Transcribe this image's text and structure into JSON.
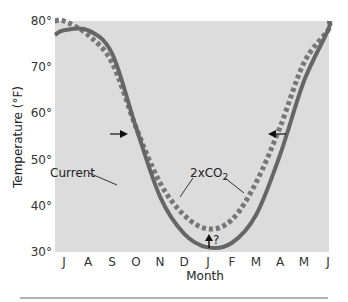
{
  "chart_data": {
    "type": "line",
    "title": "",
    "xlabel": "Month",
    "ylabel": "Temperature (°F)",
    "ylim": [
      30,
      80
    ],
    "yticks": [
      "30°",
      "40°",
      "50°",
      "60°",
      "70°",
      "80°"
    ],
    "categories": [
      "J",
      "A",
      "S",
      "O",
      "N",
      "D",
      "J",
      "F",
      "M",
      "A",
      "M",
      "J"
    ],
    "grid": false,
    "legend": "inline annotations",
    "series": [
      {
        "name": "Current",
        "style": "solid",
        "color": "#666666",
        "values": [
          78,
          78,
          73,
          57,
          42,
          34,
          31,
          32,
          38,
          51,
          67,
          78
        ]
      },
      {
        "name": "2xCO2",
        "style": "dotted",
        "color": "#777777",
        "values": [
          80,
          77,
          71,
          57,
          45,
          38,
          35,
          37,
          45,
          57,
          71,
          78
        ]
      }
    ],
    "annotations": [
      {
        "text": "Current",
        "points_to": "Current",
        "at_month": "N"
      },
      {
        "text": "2xCO2",
        "points_to": "2xCO2",
        "at_months": [
          "D",
          "M"
        ]
      },
      {
        "text": "?",
        "type": "up-arrow",
        "at_month": "J",
        "note": "Winter minimum shift uncertain"
      },
      {
        "type": "right-arrow",
        "at_month": "O",
        "y": 55
      },
      {
        "type": "left-arrow",
        "at_month": "A",
        "y": 55
      }
    ]
  },
  "labels": {
    "xlabel": "Month",
    "ylabel": "Temperature (°F)",
    "current": "Current",
    "co2": "2xCO",
    "co2_sub": "2",
    "question": "?"
  },
  "colors": {
    "plot_bg": "#dcdcdc",
    "current_line": "#666666",
    "co2_line": "#777777",
    "rule": "#999999"
  }
}
